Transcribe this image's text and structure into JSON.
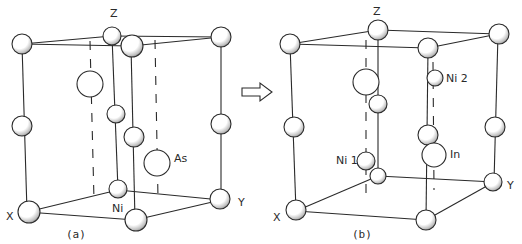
{
  "figure": {
    "panel_a": {
      "caption": "(a)",
      "axis_labels": {
        "z": "Z",
        "x": "X",
        "y": "Y"
      },
      "atom_labels": {
        "ni": "Ni",
        "as": "As"
      }
    },
    "panel_b": {
      "caption": "(b)",
      "axis_labels": {
        "z": "Z",
        "x": "X",
        "y": "Y"
      },
      "atom_labels": {
        "ni1": "Ni 1",
        "ni2": "Ni 2",
        "in": "In"
      }
    },
    "transition_arrow": "right-arrow-icon",
    "colors": {
      "line": "#2a2a2a",
      "atom_fill": "#ffffff",
      "atom_shade": "#6e6e6e",
      "background": "#ffffff"
    }
  }
}
